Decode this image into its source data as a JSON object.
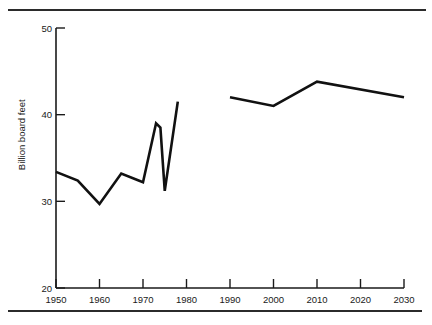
{
  "chart_data": {
    "type": "line",
    "title": "",
    "subtitle": "",
    "xlabel": "",
    "ylabel": "Billion board feet",
    "xlim": [
      1950,
      2030
    ],
    "ylim": [
      20,
      50
    ],
    "grid": false,
    "legend": "none",
    "xticks": [
      1950,
      1960,
      1970,
      1980,
      1990,
      2000,
      2010,
      2020,
      2030
    ],
    "xtick_labels": [
      "1950",
      "1960",
      "1970",
      "1980",
      "1990",
      "2000",
      "2010",
      "2020",
      "2030"
    ],
    "yticks": [
      20,
      30,
      40,
      50
    ],
    "ytick_labels": [
      "20",
      "30",
      "40",
      "50"
    ],
    "series": [
      {
        "name": "historical",
        "x": [
          1950,
          1955,
          1960,
          1965,
          1969,
          1970,
          1973,
          1974,
          1975,
          1978
        ],
        "values": [
          33.4,
          32.4,
          29.7,
          33.2,
          32.4,
          32.2,
          39.0,
          38.5,
          31.2,
          41.5
        ]
      },
      {
        "name": "projected",
        "x": [
          1990,
          2000,
          2010,
          2030
        ],
        "values": [
          42.0,
          41.0,
          43.8,
          42.0
        ]
      }
    ]
  },
  "axes": {
    "y_axis_label": "Billion board feet"
  }
}
